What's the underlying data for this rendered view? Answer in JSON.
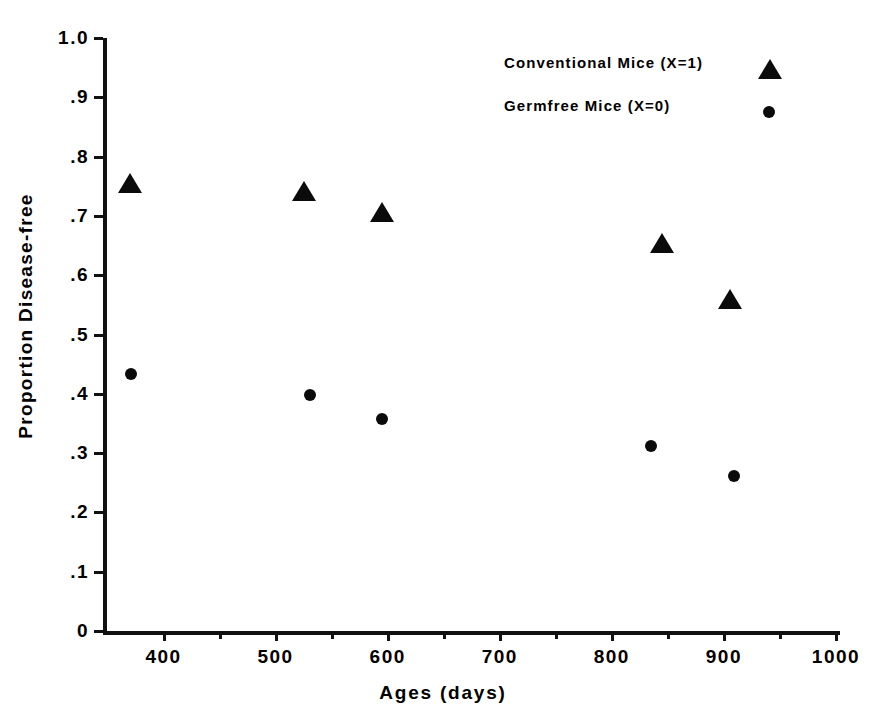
{
  "chart_data": {
    "type": "scatter",
    "title": "",
    "xlabel": "Ages (days)",
    "ylabel": "Proportion Disease-free",
    "xlim": [
      346,
      1000
    ],
    "ylim": [
      0,
      1.0
    ],
    "grid": false,
    "legend_position": "top-right",
    "x_ticks": [
      {
        "value": 400,
        "label": "400"
      },
      {
        "value": 500,
        "label": "500"
      },
      {
        "value": 600,
        "label": "600"
      },
      {
        "value": 700,
        "label": "700"
      },
      {
        "value": 800,
        "label": "800"
      },
      {
        "value": 900,
        "label": "900"
      },
      {
        "value": 1000,
        "label": "1000"
      }
    ],
    "x_minor_ticks": [
      450,
      550,
      650,
      750,
      850,
      950
    ],
    "y_ticks": [
      {
        "value": 1.0,
        "label": "1.0"
      },
      {
        "value": 0.9,
        "label": ".9"
      },
      {
        "value": 0.8,
        "label": ".8"
      },
      {
        "value": 0.7,
        "label": ".7"
      },
      {
        "value": 0.6,
        "label": ".6"
      },
      {
        "value": 0.5,
        "label": ".5"
      },
      {
        "value": 0.4,
        "label": ".4"
      },
      {
        "value": 0.3,
        "label": ".3"
      },
      {
        "value": 0.2,
        "label": ".2"
      },
      {
        "value": 0.1,
        "label": ".1"
      },
      {
        "value": 0.0,
        "label": "0"
      }
    ],
    "series": [
      {
        "name": "Conventional Mice (X=1)",
        "marker": "triangle",
        "color": "#0b0b0b",
        "points": [
          {
            "x": 370,
            "y": 0.754
          },
          {
            "x": 525,
            "y": 0.74
          },
          {
            "x": 595,
            "y": 0.705
          },
          {
            "x": 845,
            "y": 0.652
          },
          {
            "x": 905,
            "y": 0.559
          }
        ]
      },
      {
        "name": "Germfree Mice (X=0)",
        "marker": "circle",
        "color": "#0b0b0b",
        "points": [
          {
            "x": 371,
            "y": 0.433
          },
          {
            "x": 531,
            "y": 0.398
          },
          {
            "x": 595,
            "y": 0.358
          },
          {
            "x": 835,
            "y": 0.312
          },
          {
            "x": 909,
            "y": 0.262
          }
        ]
      }
    ]
  },
  "legend": {
    "entries": [
      {
        "label": "Conventional Mice (X=1)",
        "marker": "triangle"
      },
      {
        "label": "Germfree Mice (X=0)",
        "marker": "circle"
      }
    ]
  },
  "axes": {
    "x_title": "Ages (days)",
    "y_title": "Proportion Disease-free"
  }
}
